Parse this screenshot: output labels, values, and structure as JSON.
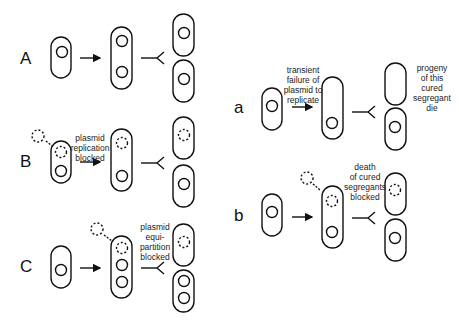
{
  "panels": {
    "A": {
      "label": "A"
    },
    "B": {
      "label": "B",
      "caption": [
        "plasmid",
        "replication",
        "blocked"
      ]
    },
    "C": {
      "label": "C",
      "caption": [
        "plasmid",
        "equi-",
        "partition",
        "blocked"
      ]
    },
    "a": {
      "label": "a",
      "caption": [
        "transient",
        "failure of",
        "plasmid to",
        "replicate"
      ],
      "note": [
        "progeny",
        "of this",
        "cured",
        "segregant",
        "die"
      ]
    },
    "b": {
      "label": "b",
      "caption": [
        "death",
        "of cured",
        "segregants",
        "blocked"
      ]
    }
  }
}
